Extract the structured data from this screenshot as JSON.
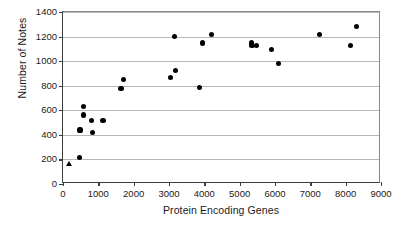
{
  "chart_data": {
    "type": "scatter",
    "title": "",
    "xlabel": "Protein Encoding Genes",
    "ylabel": "Number of Notes",
    "xlim": [
      0,
      9000
    ],
    "ylim": [
      0,
      1400
    ],
    "xticks": [
      0,
      1000,
      2000,
      3000,
      4000,
      5000,
      6000,
      7000,
      8000,
      9000
    ],
    "yticks": [
      0,
      200,
      400,
      600,
      800,
      1000,
      1200,
      1400
    ],
    "xtick_labels": [
      "0",
      "1000",
      "2000",
      "3000",
      "4000",
      "5000",
      "6000",
      "7000",
      "8000",
      "9000"
    ],
    "ytick_labels": [
      "0",
      "200",
      "400",
      "600",
      "800",
      "1000",
      "1200",
      "1400"
    ],
    "grid": "horizontal",
    "legend": "none",
    "marker_color": "#000000",
    "series": [
      {
        "name": "circles",
        "marker": "circle",
        "points": [
          {
            "x": 470,
            "y": 215
          },
          {
            "x": 480,
            "y": 440
          },
          {
            "x": 570,
            "y": 628
          },
          {
            "x": 590,
            "y": 562
          },
          {
            "x": 810,
            "y": 517
          },
          {
            "x": 830,
            "y": 422
          },
          {
            "x": 1130,
            "y": 517
          },
          {
            "x": 1640,
            "y": 778
          },
          {
            "x": 1720,
            "y": 848
          },
          {
            "x": 3040,
            "y": 870
          },
          {
            "x": 3160,
            "y": 1202
          },
          {
            "x": 3190,
            "y": 922
          },
          {
            "x": 3860,
            "y": 788
          },
          {
            "x": 3950,
            "y": 1148
          },
          {
            "x": 4200,
            "y": 1218
          },
          {
            "x": 5330,
            "y": 1148
          },
          {
            "x": 5350,
            "y": 1125
          },
          {
            "x": 5470,
            "y": 1130
          },
          {
            "x": 5900,
            "y": 1095
          },
          {
            "x": 6090,
            "y": 982
          },
          {
            "x": 7250,
            "y": 1218
          },
          {
            "x": 8140,
            "y": 1125
          },
          {
            "x": 8300,
            "y": 1282
          }
        ]
      },
      {
        "name": "triangle",
        "marker": "triangle",
        "points": [
          {
            "x": 190,
            "y": 162
          }
        ]
      }
    ]
  }
}
